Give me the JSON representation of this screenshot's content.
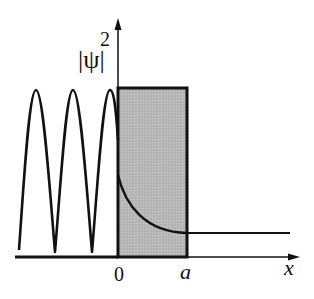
{
  "figure": {
    "type": "quantum-tunneling-probability-density",
    "y_axis_label": "|ψ|",
    "y_axis_exponent": "2",
    "x_axis_label": "x",
    "tick_labels": [
      {
        "id": "origin",
        "text": "0"
      },
      {
        "id": "barrier-width",
        "text": "a"
      }
    ],
    "regions": [
      {
        "name": "incident-region",
        "description": "oscillating probability density"
      },
      {
        "name": "barrier",
        "description": "shaded rectangular potential barrier from 0 to a",
        "fill": "#b8b8b8"
      },
      {
        "name": "transmitted-region",
        "description": "constant probability density"
      }
    ],
    "colors": {
      "line": "#111111",
      "barrier_fill": "#b8b8b8",
      "background": "#ffffff"
    }
  }
}
